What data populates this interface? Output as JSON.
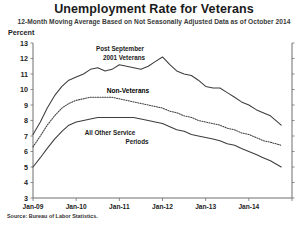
{
  "chart_data": {
    "type": "line",
    "title": "Unemployment Rate for Veterans",
    "subtitle": "12-Month Moving Average Based on Not Seasonally Adjusted Data as of October 2014",
    "ylabel": "Percent",
    "xlabel": "",
    "source": "Source: Bureau of Labor Statistics.",
    "grid": false,
    "legend": "inline-annotations",
    "ylim": [
      3,
      13
    ],
    "yticks": [
      3,
      4,
      5,
      6,
      7,
      8,
      9,
      10,
      11,
      12,
      13
    ],
    "xlim": [
      2009.0,
      2015.0
    ],
    "xticks": [
      2009.0,
      2010.0,
      2011.0,
      2012.0,
      2013.0,
      2014.0,
      2015.0
    ],
    "xticklabels": [
      "Jan-09",
      "Jan-10",
      "Jan-11",
      "Jan-12",
      "Jan-13",
      "Jan-14",
      ""
    ],
    "x": [
      2009.0,
      2009.17,
      2009.33,
      2009.5,
      2009.67,
      2009.83,
      2010.0,
      2010.17,
      2010.33,
      2010.5,
      2010.67,
      2010.83,
      2011.0,
      2011.17,
      2011.33,
      2011.5,
      2011.67,
      2011.83,
      2012.0,
      2012.17,
      2012.33,
      2012.5,
      2012.67,
      2012.83,
      2013.0,
      2013.17,
      2013.33,
      2013.5,
      2013.67,
      2013.83,
      2014.0,
      2014.17,
      2014.33,
      2014.5,
      2014.75
    ],
    "series": [
      {
        "name": "Post September 2001 Veterans",
        "style": "solid",
        "label_lines": [
          "Post September",
          "2001 Veterans"
        ],
        "values": [
          7.1,
          7.9,
          8.8,
          9.6,
          10.2,
          10.6,
          10.8,
          11.0,
          11.3,
          11.4,
          11.2,
          11.3,
          11.6,
          11.5,
          11.4,
          11.3,
          11.5,
          11.8,
          12.1,
          11.6,
          11.2,
          11.0,
          10.9,
          10.6,
          10.2,
          10.1,
          10.1,
          9.8,
          9.5,
          9.2,
          9.0,
          8.7,
          8.5,
          8.3,
          7.7
        ]
      },
      {
        "name": "Non-Veterans",
        "style": "dotted",
        "label_lines": [
          "Non-Veterans"
        ],
        "values": [
          6.3,
          7.0,
          7.7,
          8.3,
          8.8,
          9.1,
          9.3,
          9.4,
          9.5,
          9.5,
          9.5,
          9.5,
          9.4,
          9.3,
          9.2,
          9.1,
          9.0,
          8.9,
          8.8,
          8.6,
          8.5,
          8.3,
          8.2,
          8.0,
          7.9,
          7.8,
          7.7,
          7.5,
          7.4,
          7.2,
          7.1,
          6.9,
          6.7,
          6.6,
          6.4
        ]
      },
      {
        "name": "All Other Service Periods",
        "style": "solid",
        "label_lines": [
          "All Other Service",
          "Periods"
        ],
        "values": [
          5.0,
          5.6,
          6.2,
          6.8,
          7.3,
          7.7,
          7.9,
          8.0,
          8.1,
          8.2,
          8.2,
          8.2,
          8.2,
          8.2,
          8.2,
          8.1,
          8.0,
          7.9,
          7.8,
          7.6,
          7.4,
          7.3,
          7.1,
          7.0,
          6.9,
          6.8,
          6.7,
          6.5,
          6.4,
          6.2,
          6.0,
          5.8,
          5.6,
          5.4,
          5.0
        ]
      }
    ],
    "annotations": [
      {
        "text": "Post September",
        "x": 120,
        "y": 51
      },
      {
        "text": "2001 Veterans",
        "x": 124,
        "y": 60
      },
      {
        "text": "Non-Veterans",
        "x": 128,
        "y": 93
      },
      {
        "text": "All Other Service",
        "x": 110,
        "y": 135
      },
      {
        "text": "Periods",
        "x": 137,
        "y": 144
      }
    ],
    "colors": {
      "line": "#3d3d3d",
      "axis": "#6f6f6f",
      "text": "#231f20",
      "background": "#ffffff"
    }
  }
}
